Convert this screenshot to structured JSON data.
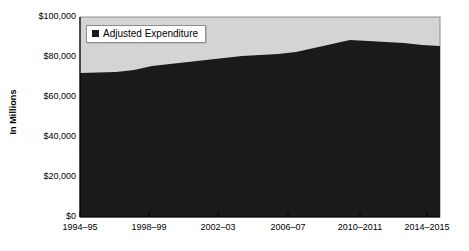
{
  "chart_data": {
    "type": "area",
    "title": "",
    "xlabel": "",
    "ylabel": "In Millions",
    "grid": false,
    "legend_position": "top-left",
    "ylim": [
      0,
      100000
    ],
    "ytick_labels": [
      "$0",
      "$20,000",
      "$40,000",
      "$60,000",
      "$80,000",
      "$100,000"
    ],
    "ytick_values": [
      0,
      20000,
      40000,
      60000,
      80000,
      100000
    ],
    "categories": [
      "1994–95",
      "1998–99",
      "2002–03",
      "2006–07",
      "2010–2011",
      "2014–2015"
    ],
    "series": [
      {
        "name": "Adjusted Expenditure",
        "color": "#1a1a1a",
        "x": [
          "1994–95",
          "1995–96",
          "1996–97",
          "1997–98",
          "1998–99",
          "1999–2000",
          "2000–01",
          "2001–02",
          "2002–03",
          "2003–04",
          "2004–05",
          "2005–06",
          "2006–07",
          "2007–08",
          "2008–09",
          "2009–10",
          "2010–2011",
          "2011–2012",
          "2012–2013",
          "2013–2014",
          "2014–2015"
        ],
        "values": [
          72000,
          72200,
          72500,
          73500,
          75500,
          76500,
          77500,
          78500,
          79500,
          80500,
          81000,
          81500,
          82500,
          84500,
          86500,
          88500,
          88000,
          87500,
          87000,
          86000,
          85500
        ]
      }
    ]
  },
  "legend": {
    "entries": [
      {
        "label": "Adjusted Expenditure",
        "swatch": "legend-swatch-black"
      }
    ]
  },
  "colors": {
    "series_fill": "#1a1a1a",
    "plot_background": "#d4d4d4",
    "plot_border": "#8d8d8d",
    "axis_line": "#000000",
    "page_background": "#ffffff"
  }
}
